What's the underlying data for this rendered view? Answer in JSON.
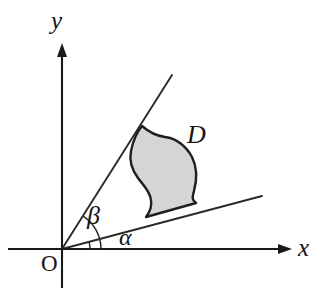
{
  "figure": {
    "kind": "geometry-diagram",
    "background_color": "#ffffff",
    "stroke_color": "#1a1a1a",
    "region_fill_color": "#d5d5d5"
  },
  "axes": {
    "x_axis": {
      "label": "x",
      "origin_px": [
        62,
        249
      ],
      "arrow_tip_px": [
        292,
        249
      ]
    },
    "y_axis": {
      "label": "y",
      "origin_px": [
        62,
        249
      ],
      "arrow_tip_px": [
        62,
        43
      ]
    },
    "origin": {
      "label": "O",
      "position_px": [
        62,
        249
      ]
    }
  },
  "rays": [
    {
      "name": "alpha-ray",
      "angle_label": "α",
      "from_px": [
        62,
        249
      ],
      "to_px": [
        262,
        196
      ],
      "approx_angle_deg": 15
    },
    {
      "name": "beta-ray",
      "angle_label": "β",
      "from_px": [
        62,
        249
      ],
      "to_px": [
        172,
        75
      ],
      "approx_angle_deg": 58
    }
  ],
  "angle_arcs": [
    {
      "name": "alpha-arc",
      "label": "α",
      "radius_px": 28,
      "from_deg": 0,
      "to_deg": 15
    },
    {
      "name": "beta-arc",
      "label": "β",
      "radius_px": 39,
      "from_deg": 0,
      "to_deg": 58
    }
  ],
  "region": {
    "label": "D",
    "label_position_px": [
      195,
      135
    ],
    "fill": "#d5d5d5",
    "touches_beta_ray_at_px": [
      142,
      126
    ],
    "rests_on_alpha_ray_from_px": [
      146,
      217
    ],
    "rests_on_alpha_ray_to_px": [
      196,
      203
    ]
  },
  "labels": {
    "x": "x",
    "y": "y",
    "origin": "O",
    "region": "D",
    "alpha": "α",
    "beta": "β"
  }
}
